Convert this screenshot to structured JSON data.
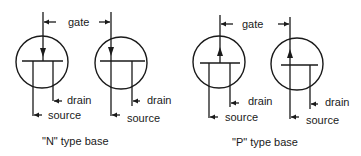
{
  "diagram": {
    "groups": [
      {
        "caption": "\"N\" type base",
        "symbols": [
          {
            "id": "n1",
            "gate_arrow": "down",
            "labels": {
              "gate": "gate",
              "drain": "drain",
              "source": "source"
            }
          },
          {
            "id": "n2",
            "gate_arrow": "down",
            "labels": {
              "drain": "drain",
              "source": "source"
            }
          }
        ]
      },
      {
        "caption": "\"P\" type base",
        "symbols": [
          {
            "id": "p1",
            "gate_arrow": "up",
            "labels": {
              "gate": "gate",
              "drain": "drain",
              "source": "source"
            }
          },
          {
            "id": "p2",
            "gate_arrow": "up",
            "labels": {
              "drain": "drain",
              "source": "source"
            }
          }
        ]
      }
    ],
    "colors": {
      "ink": "#1a1a1a",
      "background": "#ffffff"
    }
  }
}
